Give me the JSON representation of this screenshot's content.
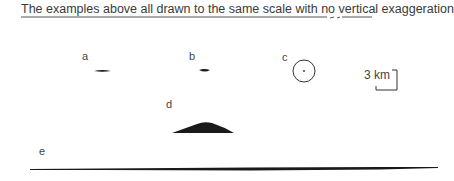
{
  "caption": "The examples above all drawn to the same scale with no vertical exaggeration",
  "labels": {
    "a": "a",
    "b": "b",
    "c": "c",
    "d": "d",
    "e": "e"
  },
  "scale_bar": {
    "label": "3 km"
  },
  "colors": {
    "ink": "#1a1a1a",
    "text": "#3a3a3a",
    "background": "#ffffff"
  }
}
